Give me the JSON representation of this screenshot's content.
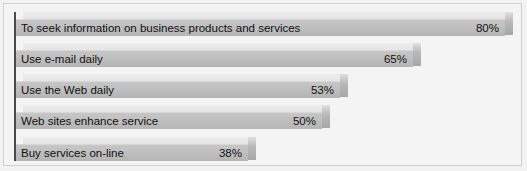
{
  "chart_data": {
    "type": "bar",
    "orientation": "horizontal",
    "title": "",
    "subtitle": "",
    "xlabel": "",
    "ylabel": "",
    "xlim": [
      0,
      80
    ],
    "grid": false,
    "legend": false,
    "value_suffix": "%",
    "categories": [
      "To seek information on business products and services",
      "Use e-mail daily",
      "Use the Web daily",
      "Web sites enhance service",
      "Buy services on-line"
    ],
    "values": [
      80,
      65,
      53,
      50,
      38
    ],
    "value_labels": [
      "80%",
      "65%",
      "53%",
      "50%",
      "38%"
    ],
    "bars": [
      {
        "label": "To seek information on business products and services",
        "value": 80,
        "value_label": "80%"
      },
      {
        "label": "Use e-mail daily",
        "value": 65,
        "value_label": "65%"
      },
      {
        "label": "Use the Web daily",
        "value": 53,
        "value_label": "53%"
      },
      {
        "label": "Web sites enhance service",
        "value": 50,
        "value_label": "50%"
      },
      {
        "label": "Buy services on-line",
        "value": 38,
        "value_label": "38%"
      }
    ]
  },
  "style": {
    "background": "#f4f4f4",
    "bar_face": "#bfbfbf",
    "bar_top": "#e8e8e8",
    "bar_cap": "#b9b9b9",
    "axis": "#4a4a4a",
    "text": "#111111"
  },
  "layout": {
    "rows_top": [
      12,
      43,
      74,
      105,
      137
    ],
    "axis_left": 15,
    "px_per_unit": 6.13
  }
}
